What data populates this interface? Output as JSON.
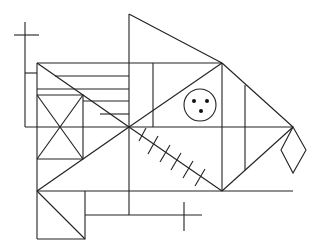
{
  "figure": {
    "type": "geometric-line-drawing",
    "stroke_color": "#222222",
    "background": "#ffffff"
  },
  "elements": {
    "main_rectangle": {
      "x": 37,
      "y": 63,
      "width": 92,
      "height": 128
    },
    "vertical_spine": {
      "x": 129,
      "y1": 14,
      "y2": 215
    },
    "circle": {
      "cx": 200,
      "cy": 105,
      "r": 16,
      "dots": 3
    },
    "hatch_ticks": 6,
    "diamond": {
      "points": "293,127 306,150 293,173 281,150"
    }
  }
}
